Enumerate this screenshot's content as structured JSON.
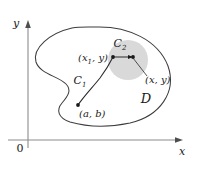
{
  "figure": {
    "caption_absent": true,
    "axes": {
      "y_label": "y",
      "x_label": "x",
      "origin_label": "0"
    },
    "region": {
      "label": "D"
    },
    "curves": [
      {
        "name": "curve-c1",
        "label_base": "C",
        "label_sub": "1"
      },
      {
        "name": "curve-c2",
        "label_base": "C",
        "label_sub": "2"
      }
    ],
    "points": [
      {
        "name": "start-point",
        "label": "(a, b)"
      },
      {
        "name": "intermediate-point",
        "label_prefix": "(x",
        "label_sub": "1",
        "label_suffix": ", y)"
      },
      {
        "name": "end-point",
        "label": "(x, y)"
      }
    ],
    "colors": {
      "disk_fill": "#d2d2d2",
      "outline": "#3d3d3d",
      "axis": "#8c8c8c",
      "text": "#1a1a1a",
      "background": "#ffffff"
    }
  }
}
